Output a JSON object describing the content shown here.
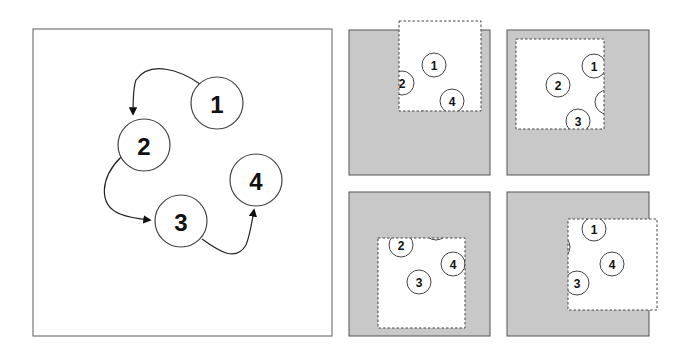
{
  "main_diagram": {
    "frame": {
      "x": 33,
      "y": 29,
      "w": 299,
      "h": 307
    },
    "node_radius": 26,
    "nodes": [
      {
        "label": "1",
        "cx": 217,
        "cy": 103
      },
      {
        "label": "2",
        "cx": 144,
        "cy": 145
      },
      {
        "label": "3",
        "cx": 181,
        "cy": 221
      },
      {
        "label": "4",
        "cx": 256,
        "cy": 180
      }
    ],
    "edges": [
      {
        "from": "1",
        "to": "2",
        "path": "M200,84 C180,70 150,60 136,80 C133,88 133,100 133,114"
      },
      {
        "from": "2",
        "to": "3",
        "path": "M121,157 C100,178 98,205 120,214 C130,218 140,219 150,220"
      },
      {
        "from": "3",
        "to": "4",
        "path": "M202,239 C220,252 236,262 246,245 C250,235 252,222 254,210"
      }
    ]
  },
  "views": [
    {
      "name": "view-top-left",
      "panel": {
        "x": 349,
        "y": 30,
        "w": 141,
        "h": 145
      },
      "viewport": {
        "x": 399,
        "y": 21,
        "w": 82,
        "h": 90
      },
      "nodes": [
        {
          "label": "1",
          "cx": 434,
          "cy": 65
        },
        {
          "label": "2",
          "cx": 402,
          "cy": 83
        },
        {
          "label": "4",
          "cx": 452,
          "cy": 101
        },
        {
          "label": "3",
          "cx": 423,
          "cy": 123
        }
      ]
    },
    {
      "name": "view-top-right",
      "panel": {
        "x": 507,
        "y": 30,
        "w": 142,
        "h": 145
      },
      "viewport": {
        "x": 516,
        "y": 39,
        "w": 88,
        "h": 90
      },
      "nodes": [
        {
          "label": "1",
          "cx": 594,
          "cy": 66
        },
        {
          "label": "2",
          "cx": 558,
          "cy": 85
        },
        {
          "label": "4",
          "cx": 607,
          "cy": 102
        },
        {
          "label": "3",
          "cx": 578,
          "cy": 121
        }
      ]
    },
    {
      "name": "view-bottom-left",
      "panel": {
        "x": 349,
        "y": 192,
        "w": 141,
        "h": 144
      },
      "viewport": {
        "x": 378,
        "y": 238,
        "w": 87,
        "h": 90
      },
      "nodes": [
        {
          "label": "2",
          "cx": 401,
          "cy": 245
        },
        {
          "label": "1",
          "cx": 436,
          "cy": 228
        },
        {
          "label": "4",
          "cx": 453,
          "cy": 264
        },
        {
          "label": "3",
          "cx": 419,
          "cy": 282
        }
      ]
    },
    {
      "name": "view-bottom-right",
      "panel": {
        "x": 507,
        "y": 192,
        "w": 142,
        "h": 144
      },
      "viewport": {
        "x": 568,
        "y": 219,
        "w": 89,
        "h": 91
      },
      "nodes": [
        {
          "label": "1",
          "cx": 594,
          "cy": 229
        },
        {
          "label": "2",
          "cx": 558,
          "cy": 247
        },
        {
          "label": "4",
          "cx": 612,
          "cy": 264
        },
        {
          "label": "3",
          "cx": 577,
          "cy": 283
        }
      ]
    }
  ],
  "mini_node_radius": 12,
  "colors": {
    "panel_fill": "#c8c8c8",
    "stroke": "#555555",
    "node_stroke": "#444444",
    "viewport_fill": "#ffffff"
  }
}
